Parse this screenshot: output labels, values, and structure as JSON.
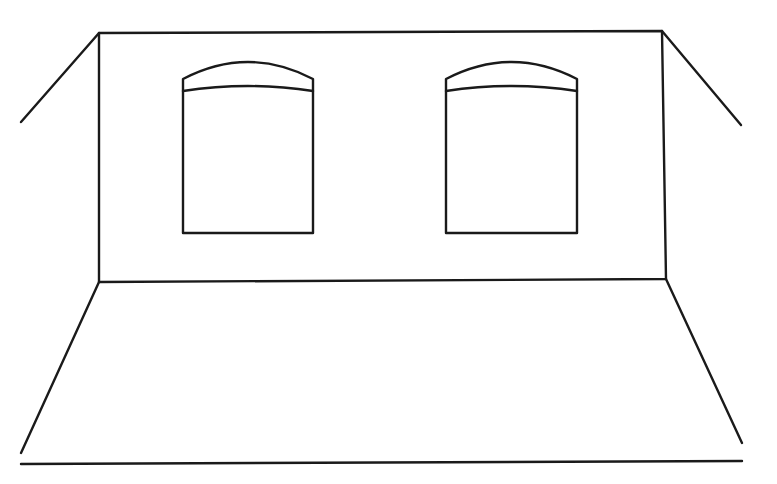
{
  "figure": {
    "type": "line-drawing",
    "stroke_color": "#1a1a1a",
    "background": "#ffffff",
    "stroke_width": 2.4
  },
  "room": {
    "back_wall": {
      "top_left": [
        99,
        33
      ],
      "top_right": [
        662,
        31
      ],
      "bottom_left": [
        99,
        282
      ],
      "bottom_right": [
        666,
        279
      ]
    },
    "left_ceiling_edge": {
      "from": [
        99,
        33
      ],
      "to": [
        21,
        122
      ]
    },
    "right_ceiling_edge": {
      "from": [
        662,
        31
      ],
      "to": [
        741,
        125
      ]
    },
    "left_floor_edge": {
      "from": [
        99,
        282
      ],
      "to": [
        21,
        453
      ]
    },
    "right_floor_edge": {
      "from": [
        666,
        279
      ],
      "to": [
        742,
        443
      ]
    },
    "floor_front_edge": {
      "from": [
        21,
        464
      ],
      "to": [
        742,
        461
      ]
    }
  },
  "windows": [
    {
      "name": "left-window",
      "left": 183,
      "right": 313,
      "arch_side_y": 79,
      "arch_top_y": 62,
      "inner_side_y": 91,
      "inner_top_y": 86,
      "bottom": 233
    },
    {
      "name": "right-window",
      "left": 446,
      "right": 577,
      "arch_side_y": 79,
      "arch_top_y": 62,
      "inner_side_y": 91,
      "inner_top_y": 86,
      "bottom": 233
    }
  ]
}
